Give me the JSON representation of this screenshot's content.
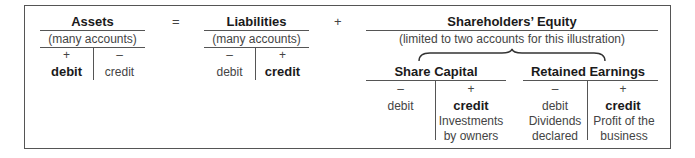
{
  "diagram": {
    "assets": {
      "title": "Assets",
      "subtitle": "(many accounts)",
      "left_sign": "+",
      "right_sign": "–",
      "left_label": "debit",
      "right_label": "credit"
    },
    "equals": "=",
    "liabilities": {
      "title": "Liabilities",
      "subtitle": "(many accounts)",
      "left_sign": "–",
      "right_sign": "+",
      "left_label": "debit",
      "right_label": "credit"
    },
    "plus": "+",
    "equity": {
      "title": "Shareholders’ Equity",
      "subtitle": "(limited to two accounts for this illustration)",
      "share_capital": {
        "title": "Share Capital",
        "left_sign": "–",
        "right_sign": "+",
        "left_label": "debit",
        "right_label": "credit",
        "right_desc_1": "Investments",
        "right_desc_2": "by owners"
      },
      "retained_earnings": {
        "title": "Retained Earnings",
        "left_sign": "–",
        "right_sign": "+",
        "left_label": "debit",
        "right_label": "credit",
        "left_desc_1": "Dividends",
        "left_desc_2": "declared",
        "right_desc_1": "Profit of the",
        "right_desc_2": "business"
      }
    }
  }
}
